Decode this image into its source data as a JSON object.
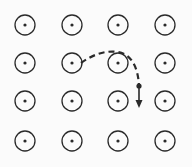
{
  "diagram": {
    "field_symbol": "dot-in-circle (out of page)",
    "grid": {
      "rows": 4,
      "cols": 4,
      "col_x": [
        25,
        72,
        118,
        165
      ],
      "row_y": [
        25,
        63,
        101,
        141
      ],
      "circle_radius": 10,
      "dot_radius": 1.6
    },
    "trajectory": {
      "style": "dashed",
      "path": "M 81 63 C 92 55, 105 50, 118 52 C 130 54, 138 65, 139 86",
      "particle_position": [
        139,
        86
      ],
      "velocity_arrow": {
        "from": [
          139,
          86
        ],
        "to": [
          139,
          108
        ],
        "direction": "down"
      }
    },
    "colors": {
      "stroke": "#2a2a2a",
      "background": "#fbfbfb"
    }
  }
}
